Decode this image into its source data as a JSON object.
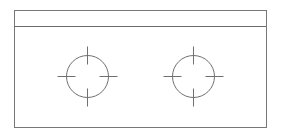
{
  "document": {
    "title": "Engineering Part Drawing",
    "view_name": "plan-view",
    "background_color": "#ffffff",
    "canvas": {
      "width": 282,
      "height": 139
    }
  },
  "style": {
    "line_color": "#6b6b6b",
    "outline_color": "#777777",
    "circle_color": "#707070",
    "crosshair_color": "#707070",
    "line_width": 1,
    "fill": "none"
  },
  "geometry": {
    "outer_rectangle": {
      "label": "plate-outline",
      "x": 14,
      "y": 10,
      "width": 252,
      "height": 117
    },
    "divider_line": {
      "label": "top-edge-divider",
      "x1": 14,
      "y1": 26,
      "x2": 266,
      "y2": 26
    },
    "top_strip": {
      "label": "top-flange-strip",
      "x": 14,
      "y": 10,
      "width": 252,
      "height": 16
    },
    "holes": [
      {
        "id": "hole-left",
        "label": "Left Hole",
        "center_x": 87,
        "center_y": 76,
        "radius": 21,
        "crosshair_extension": 9
      },
      {
        "id": "hole-right",
        "label": "Right Hole",
        "center_x": 193,
        "center_y": 76,
        "radius": 21,
        "crosshair_extension": 9
      }
    ]
  }
}
